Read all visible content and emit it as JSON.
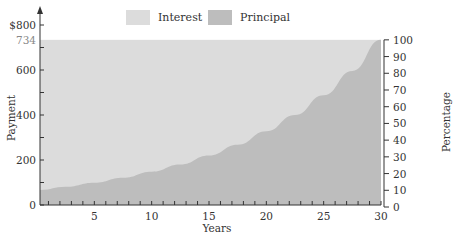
{
  "chart_data": {
    "type": "area",
    "title": "",
    "xlabel": "Years",
    "ylabel": "Payment",
    "ylabel_right": "Percentage",
    "x_ticks": [
      "5",
      "10",
      "15",
      "20",
      "25",
      "30"
    ],
    "y_ticks_left": [
      "0",
      "200",
      "400",
      "600",
      "734",
      "$800"
    ],
    "y_ticks_right": [
      "0",
      "10",
      "20",
      "30",
      "40",
      "50",
      "60",
      "70",
      "80",
      "90",
      "100"
    ],
    "xlim": [
      0,
      30
    ],
    "ylim": [
      0,
      800
    ],
    "total_payment": 734,
    "x": [
      0,
      2.5,
      5,
      7.5,
      10,
      12.5,
      15,
      17.5,
      20,
      22.5,
      25,
      27.5,
      30
    ],
    "series": [
      {
        "name": "Principal",
        "color": "#bdbdbd",
        "values": [
          67,
          81,
          99,
          121,
          148,
          180,
          220,
          268,
          328,
          400,
          488,
          596,
          734
        ]
      },
      {
        "name": "Interest",
        "color": "#dcdcdc",
        "values": [
          667,
          653,
          635,
          613,
          586,
          554,
          514,
          466,
          406,
          334,
          246,
          138,
          0
        ]
      }
    ],
    "legend": [
      "Interest",
      "Principal"
    ],
    "legend_position": "top",
    "grid": false
  },
  "legend": {
    "interest_label": "Interest",
    "principal_label": "Principal"
  }
}
